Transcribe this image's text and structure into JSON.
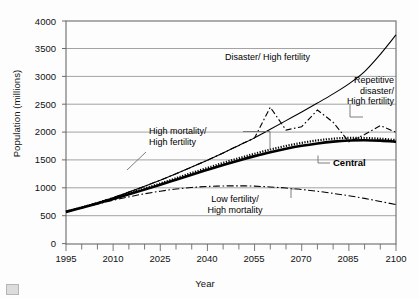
{
  "figure": {
    "axis": {
      "ylabel": "Population (millions)",
      "xlabel": "Year",
      "yticks": [
        "0",
        "500",
        "1000",
        "1500",
        "2000",
        "2500",
        "3000",
        "3500",
        "4000"
      ],
      "xticks": [
        "1995",
        "2010",
        "2025",
        "2040",
        "2055",
        "2070",
        "2085",
        "2100"
      ],
      "ylim": [
        0,
        4000
      ],
      "xlim": [
        1995,
        2100
      ],
      "ymajor_step": 500,
      "xmajor_step": 15,
      "xminor_step": 5,
      "grid": "horizontal",
      "frame": true
    },
    "labels": {
      "disaster_high_fertility": "Disaster/ High fertility",
      "repetitive_line1": "Repetitive",
      "repetitive_line2": "disaster/",
      "repetitive_line3": "High fertility",
      "high_mortality_line1": "High mortality/",
      "high_mortality_line2": "High fertility",
      "central": "Central",
      "low_fertility_line1": "Low fertility/",
      "low_fertility_line2": "High mortality"
    },
    "colors": {
      "line": "#000000",
      "grid": "#8c8c8c",
      "frame": "#6b6b6b",
      "background": "#fdfdfd"
    }
  },
  "chart_data": {
    "type": "line",
    "title": "",
    "xlabel": "Year",
    "ylabel": "Population (millions)",
    "xlim": [
      1995,
      2100
    ],
    "ylim": [
      0,
      4000
    ],
    "grid": "horizontal major gridlines only",
    "legend": "inline annotations pointing at each curve",
    "x": [
      1995,
      2000,
      2005,
      2010,
      2015,
      2020,
      2025,
      2030,
      2035,
      2040,
      2045,
      2050,
      2055,
      2060,
      2065,
      2070,
      2075,
      2080,
      2085,
      2090,
      2095,
      2100
    ],
    "series": [
      {
        "name": "Disaster/ High fertility",
        "style": "solid thin",
        "values": [
          570,
          650,
          735,
          825,
          925,
          1030,
          1140,
          1255,
          1375,
          1500,
          1630,
          1765,
          1900,
          2055,
          2210,
          2365,
          2525,
          2690,
          2870,
          3090,
          3400,
          3750
        ]
      },
      {
        "name": "Repetitive disaster/ High fertility",
        "style": "dash-dot zigzag",
        "values": [
          570,
          650,
          735,
          825,
          925,
          1030,
          1140,
          1255,
          1375,
          1500,
          1630,
          1765,
          1900,
          2450,
          2040,
          2100,
          2400,
          2180,
          1830,
          1960,
          2120,
          2000
        ]
      },
      {
        "name": "High mortality/ High fertility",
        "style": "dotted heavy",
        "values": [
          575,
          650,
          730,
          815,
          900,
          990,
          1080,
          1175,
          1270,
          1360,
          1450,
          1535,
          1615,
          1690,
          1755,
          1810,
          1855,
          1885,
          1900,
          1898,
          1885,
          1860
        ]
      },
      {
        "name": "Central",
        "style": "solid thick",
        "values": [
          570,
          645,
          722,
          802,
          885,
          970,
          1058,
          1148,
          1238,
          1325,
          1412,
          1495,
          1572,
          1643,
          1705,
          1758,
          1800,
          1832,
          1852,
          1858,
          1850,
          1830
        ]
      },
      {
        "name": "Low fertility/ High mortality",
        "style": "dash-dot thin",
        "values": [
          570,
          640,
          710,
          778,
          840,
          895,
          942,
          980,
          1008,
          1027,
          1036,
          1038,
          1032,
          1018,
          998,
          972,
          940,
          902,
          860,
          812,
          758,
          700
        ]
      }
    ]
  }
}
